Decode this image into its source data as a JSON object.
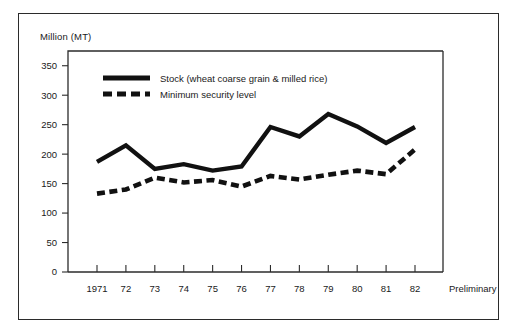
{
  "figure": {
    "unit_label": "Million (MT)",
    "preliminary_note": "Preliminary",
    "frame_color": "#2b2b2b",
    "ink_color": "#111111",
    "background_color": "#ffffff"
  },
  "chart_data": {
    "type": "line",
    "title": "",
    "subtitle": "",
    "xlabel": "",
    "ylabel": "Million (MT)",
    "categories": [
      "1971",
      "72",
      "73",
      "74",
      "75",
      "76",
      "77",
      "78",
      "79",
      "80",
      "81",
      "82"
    ],
    "x_tick_labels": [
      "1971",
      "72",
      "73",
      "74",
      "75",
      "76",
      "77",
      "78",
      "79",
      "80",
      "81",
      "82"
    ],
    "y_tick_labels": [
      "0",
      "50",
      "100",
      "150",
      "200",
      "250",
      "300",
      "350"
    ],
    "y_ticks": [
      0,
      50,
      100,
      150,
      200,
      250,
      300,
      350
    ],
    "ylim": [
      0,
      375
    ],
    "grid": false,
    "legend_position": "upper-left-inside",
    "annotations": [
      "Preliminary"
    ],
    "series": [
      {
        "name": "Stock (wheat coarse grain & milled rice)",
        "style": "solid",
        "values": [
          187,
          215,
          175,
          183,
          172,
          179,
          246,
          230,
          268,
          247,
          219,
          246
        ]
      },
      {
        "name": "Minimum security level",
        "style": "dashed",
        "values": [
          133,
          140,
          160,
          152,
          156,
          145,
          163,
          157,
          165,
          172,
          166,
          208
        ]
      }
    ]
  },
  "legend": {
    "entries": [
      {
        "label": "Stock (wheat coarse grain & milled rice)",
        "style": "solid"
      },
      {
        "label": "Minimum security level",
        "style": "dashed"
      }
    ]
  }
}
